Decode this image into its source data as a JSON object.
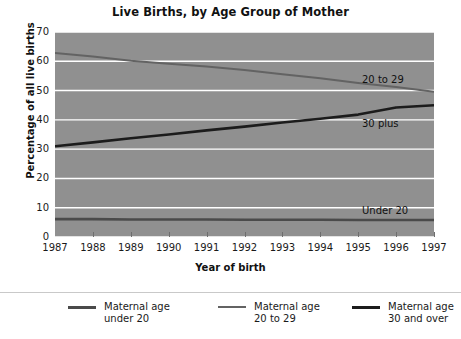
{
  "chart_data": {
    "type": "line",
    "title": "Live Births, by Age Group of Mother",
    "xlabel": "Year of birth",
    "ylabel": "Percentage of all live births",
    "x": [
      1987,
      1988,
      1989,
      1990,
      1991,
      1992,
      1993,
      1994,
      1995,
      1996,
      1997
    ],
    "xlim": [
      1987,
      1997
    ],
    "ylim": [
      0,
      70
    ],
    "yticks": [
      0,
      10,
      20,
      30,
      40,
      50,
      60,
      70
    ],
    "xticks": [
      "1987",
      "1988",
      "1989",
      "1990",
      "1991",
      "1992",
      "1993",
      "1994",
      "1995",
      "1996",
      "1997"
    ],
    "grid": true,
    "grid_color": "#ffffff",
    "plot_background": "#909090",
    "legend_position": "below",
    "series": [
      {
        "name": "Maternal age under 20",
        "short_label": "Under 20",
        "color": "#4a4a4a",
        "width": 2.6,
        "values": [
          6.1,
          6.1,
          6.0,
          6.0,
          6.0,
          5.9,
          5.9,
          5.9,
          5.8,
          5.8,
          5.8
        ]
      },
      {
        "name": "Maternal age 20 to 29",
        "short_label": "20 to 29",
        "color": "#636363",
        "width": 2.0,
        "values": [
          62.8,
          61.6,
          60.2,
          59.2,
          58.2,
          57.0,
          55.6,
          54.2,
          52.6,
          51.2,
          49.6
        ]
      },
      {
        "name": "Maternal age 30 and over",
        "short_label": "30 plus",
        "color": "#1c1c1c",
        "width": 2.6,
        "values": [
          31.0,
          32.3,
          33.7,
          35.0,
          36.4,
          37.7,
          39.1,
          40.4,
          41.8,
          44.2,
          45.0
        ]
      }
    ],
    "annotations": [
      {
        "text": "20 to 29",
        "x": 1995.1,
        "y": 53.5
      },
      {
        "text": "30 plus",
        "x": 1995.1,
        "y": 38.5
      },
      {
        "text": "Under 20",
        "x": 1995.1,
        "y": 9.0
      }
    ]
  },
  "legend": {
    "items": [
      {
        "line1": "Maternal age",
        "line2": "under 20",
        "color": "#4a4a4a",
        "thickness": "2.6px"
      },
      {
        "line1": "Maternal age",
        "line2": "20 to 29",
        "color": "#636363",
        "thickness": "2.2px"
      },
      {
        "line1": "Maternal age",
        "line2": "30 and over",
        "color": "#1c1c1c",
        "thickness": "3px"
      }
    ]
  }
}
